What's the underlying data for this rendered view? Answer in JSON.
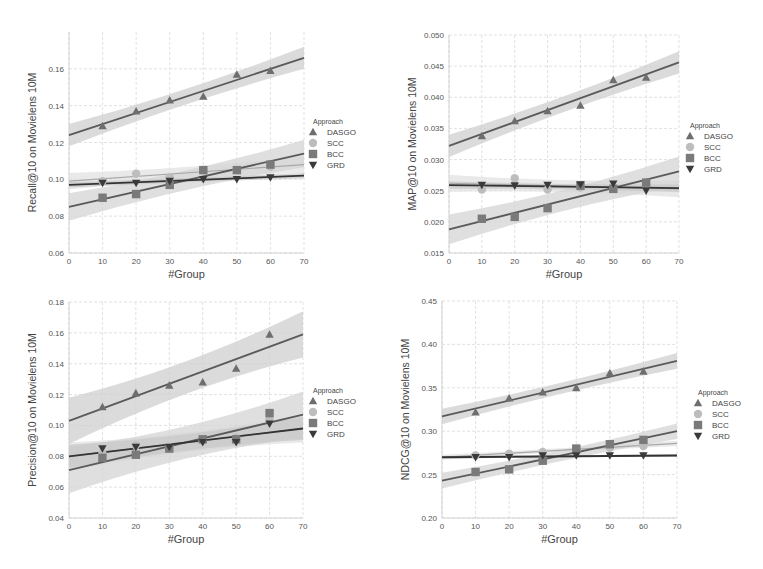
{
  "legend": {
    "title": "Approach",
    "entries": [
      "DASGO",
      "SCC",
      "BCC",
      "GRD"
    ]
  },
  "styles": {
    "DASGO": {
      "marker": "triangle-up",
      "color": "#6e6e6e",
      "band": "#cfcfcf"
    },
    "SCC": {
      "marker": "circle",
      "color": "#bdbdbd",
      "band": "#e2e2e2"
    },
    "BCC": {
      "marker": "square",
      "color": "#7a7a7a",
      "band": "#d4d4d4"
    },
    "GRD": {
      "marker": "triangle-down",
      "color": "#3a3a3a",
      "band": "#c8c8c8"
    }
  },
  "chart_data": [
    {
      "type": "scatter",
      "title": "",
      "xlabel": "#Group",
      "ylabel": "Recall@10 on Movielens 10M",
      "xlim": [
        0,
        70
      ],
      "ylim": [
        0.06,
        0.18
      ],
      "xticks": [
        0,
        10,
        20,
        30,
        40,
        50,
        60,
        70
      ],
      "yticks": [
        0.06,
        0.08,
        0.1,
        0.12,
        0.14,
        0.16
      ],
      "ytick_labels": [
        "0.06",
        "0.08",
        "0.10",
        "0.12",
        "0.14",
        "0.16"
      ],
      "grid": true,
      "legend_position": "right",
      "x": [
        10,
        20,
        30,
        40,
        50,
        60
      ],
      "series": [
        {
          "name": "DASGO",
          "values": [
            0.129,
            0.137,
            0.143,
            0.145,
            0.157,
            0.159
          ],
          "fit": [
            0.124,
            0.166
          ],
          "band": 0.004
        },
        {
          "name": "SCC",
          "values": [
            0.099,
            0.103,
            0.101,
            0.105,
            0.105,
            0.107
          ],
          "fit": [
            0.099,
            0.108
          ],
          "band": 0.003
        },
        {
          "name": "BCC",
          "values": [
            0.09,
            0.092,
            0.097,
            0.105,
            0.105,
            0.108
          ],
          "fit": [
            0.085,
            0.114
          ],
          "band": 0.005
        },
        {
          "name": "GRD",
          "values": [
            0.098,
            0.098,
            0.099,
            0.1,
            0.1,
            0.101
          ],
          "fit": [
            0.097,
            0.102
          ],
          "band": 0.001
        }
      ]
    },
    {
      "type": "scatter",
      "title": "",
      "xlabel": "#Group",
      "ylabel": "MAP@10 on Movielens 10M",
      "xlim": [
        0,
        70
      ],
      "ylim": [
        0.015,
        0.05
      ],
      "xticks": [
        0,
        10,
        20,
        30,
        40,
        50,
        60,
        70
      ],
      "yticks": [
        0.015,
        0.02,
        0.025,
        0.03,
        0.035,
        0.04,
        0.045,
        0.05
      ],
      "ytick_labels": [
        "0.015",
        "0.020",
        "0.025",
        "0.030",
        "0.035",
        "0.040",
        "0.045",
        "0.050"
      ],
      "grid": true,
      "legend_position": "right",
      "x": [
        10,
        20,
        30,
        40,
        50,
        60
      ],
      "series": [
        {
          "name": "DASGO",
          "values": [
            0.0338,
            0.0362,
            0.0378,
            0.0387,
            0.0428,
            0.0432
          ],
          "fit": [
            0.0322,
            0.0456
          ],
          "band": 0.0012
        },
        {
          "name": "SCC",
          "values": [
            0.0252,
            0.027,
            0.0252,
            0.0255,
            0.0253,
            0.0258
          ],
          "fit": [
            0.0262,
            0.0253
          ],
          "band": 0.0009
        },
        {
          "name": "BCC",
          "values": [
            0.0205,
            0.0208,
            0.0222,
            0.0258,
            0.0253,
            0.0263
          ],
          "fit": [
            0.0188,
            0.0281
          ],
          "band": 0.0016
        },
        {
          "name": "GRD",
          "values": [
            0.0259,
            0.0258,
            0.0259,
            0.026,
            0.0261,
            0.025
          ],
          "fit": [
            0.0259,
            0.0254
          ],
          "band": 0.0004
        }
      ]
    },
    {
      "type": "scatter",
      "title": "",
      "xlabel": "#Group",
      "ylabel": "Precision@10 on Movielens 10M",
      "xlim": [
        0,
        70
      ],
      "ylim": [
        0.04,
        0.18
      ],
      "xticks": [
        0,
        10,
        20,
        30,
        40,
        50,
        60,
        70
      ],
      "yticks": [
        0.04,
        0.06,
        0.08,
        0.1,
        0.12,
        0.14,
        0.16,
        0.18
      ],
      "ytick_labels": [
        "0.04",
        "0.06",
        "0.08",
        "0.10",
        "0.12",
        "0.14",
        "0.16",
        "0.18"
      ],
      "grid": true,
      "legend_position": "right",
      "x": [
        10,
        20,
        30,
        40,
        50,
        60
      ],
      "series": [
        {
          "name": "DASGO",
          "values": [
            0.112,
            0.121,
            0.126,
            0.128,
            0.137,
            0.159
          ],
          "fit": [
            0.103,
            0.159
          ],
          "band": 0.01
        },
        {
          "name": "SCC",
          "values": [
            0.082,
            0.087,
            0.086,
            0.09,
            0.092,
            0.104
          ],
          "fit": [
            0.08,
            0.098
          ],
          "band": 0.006
        },
        {
          "name": "BCC",
          "values": [
            0.079,
            0.081,
            0.085,
            0.091,
            0.091,
            0.108
          ],
          "fit": [
            0.071,
            0.107
          ],
          "band": 0.01
        },
        {
          "name": "GRD",
          "values": [
            0.085,
            0.086,
            0.086,
            0.089,
            0.089,
            0.101
          ],
          "fit": [
            0.08,
            0.098
          ],
          "band": 0.005
        }
      ]
    },
    {
      "type": "scatter",
      "title": "",
      "xlabel": "#Group",
      "ylabel": "NDCG@10 on Movielens 10M",
      "xlim": [
        0,
        70
      ],
      "ylim": [
        0.2,
        0.45
      ],
      "xticks": [
        0,
        10,
        20,
        30,
        40,
        50,
        60,
        70
      ],
      "yticks": [
        0.2,
        0.25,
        0.3,
        0.35,
        0.4,
        0.45
      ],
      "ytick_labels": [
        "0.20",
        "0.25",
        "0.30",
        "0.35",
        "0.40",
        "0.45"
      ],
      "grid": true,
      "legend_position": "right",
      "x": [
        10,
        20,
        30,
        40,
        50,
        60
      ],
      "series": [
        {
          "name": "DASGO",
          "values": [
            0.322,
            0.338,
            0.345,
            0.35,
            0.367,
            0.369
          ],
          "fit": [
            0.317,
            0.381
          ],
          "band": 0.006
        },
        {
          "name": "SCC",
          "values": [
            0.272,
            0.274,
            0.276,
            0.278,
            0.281,
            0.283
          ],
          "fit": [
            0.27,
            0.286
          ],
          "band": 0.002
        },
        {
          "name": "BCC",
          "values": [
            0.253,
            0.256,
            0.266,
            0.28,
            0.285,
            0.29
          ],
          "fit": [
            0.243,
            0.3
          ],
          "band": 0.006
        },
        {
          "name": "GRD",
          "values": [
            0.27,
            0.27,
            0.272,
            0.272,
            0.272,
            0.272
          ],
          "fit": [
            0.27,
            0.272
          ],
          "band": 0.001
        }
      ]
    }
  ]
}
